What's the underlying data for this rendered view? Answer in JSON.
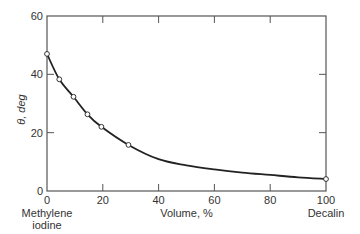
{
  "chart_data": {
    "type": "line",
    "title": "",
    "xlabel": "Volume, %",
    "ylabel": "θ, deg",
    "xlim": [
      0,
      100
    ],
    "ylim": [
      0,
      60
    ],
    "x_ticks": [
      0,
      20,
      40,
      60,
      80,
      100
    ],
    "y_ticks": [
      0,
      20,
      40,
      60
    ],
    "x_tick_labels": [
      "0",
      "20",
      "40",
      "60",
      "80",
      "100"
    ],
    "y_tick_labels": [
      "0",
      "20",
      "40",
      "60"
    ],
    "x_end_labels": {
      "left": [
        "Methylene",
        "iodine"
      ],
      "right": "Decalin"
    },
    "grid": false,
    "legend": null,
    "series": [
      {
        "name": "measured",
        "marker": "open-circle",
        "x": [
          0,
          4.4,
          9.5,
          14.5,
          19.5,
          29.2,
          100
        ],
        "y": [
          47,
          38.3,
          32.3,
          26.3,
          22.0,
          15.8,
          4.1
        ]
      },
      {
        "name": "fitted curve",
        "marker": "none",
        "x": [
          0,
          4.4,
          9.5,
          14.5,
          19.5,
          29.2,
          40,
          50,
          60,
          70,
          80,
          90,
          100
        ],
        "y": [
          47,
          38.3,
          32.3,
          26.3,
          22.0,
          15.8,
          10.9,
          8.8,
          7.4,
          6.3,
          5.5,
          4.7,
          4.1
        ]
      }
    ]
  }
}
